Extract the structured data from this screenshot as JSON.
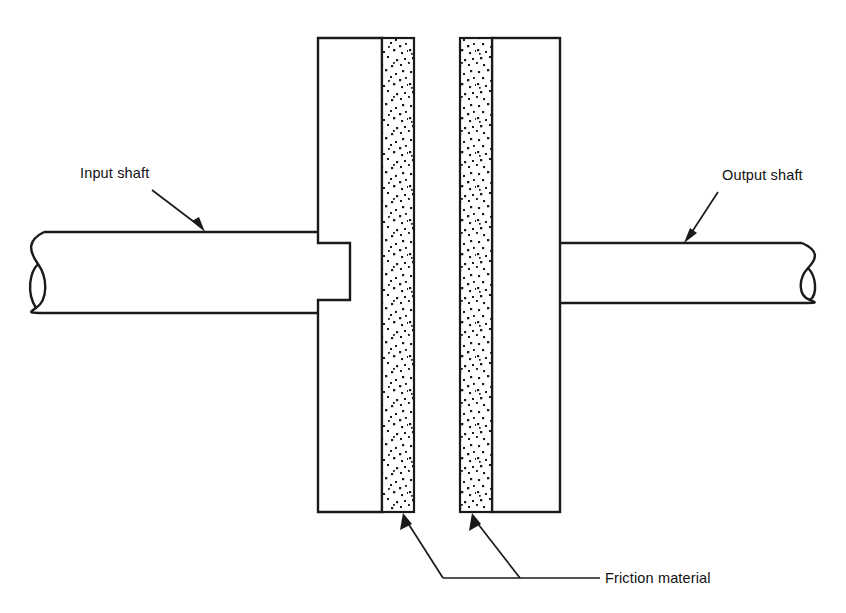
{
  "figure": {
    "background_color": "#ffffff",
    "line_color": "#1a1a1a",
    "stipple_color": "#1a1a1a",
    "width": 846,
    "height": 613
  },
  "labels": {
    "input_shaft": "Input shaft",
    "output_shaft": "Output shaft",
    "friction_material": "Friction material"
  },
  "components": {
    "input_shaft": {
      "name": "Input shaft",
      "side": "left",
      "x_start": 30,
      "x_end": 320,
      "y_top": 232,
      "y_bottom": 313,
      "break_line": true
    },
    "output_shaft": {
      "name": "Output shaft",
      "side": "right",
      "x_start": 560,
      "x_end": 818,
      "y_top": 243,
      "y_bottom": 303,
      "break_line": true
    },
    "driving_plate": {
      "name": "Driving plate",
      "x_start": 318,
      "x_end": 414,
      "y_top": 38,
      "y_bottom": 512,
      "friction_face": "right"
    },
    "driven_plate": {
      "name": "Driven plate",
      "x_start": 460,
      "x_end": 560,
      "y_top": 38,
      "y_bottom": 512,
      "friction_face": "left"
    },
    "friction_band_left": {
      "name": "Friction material (driving plate)",
      "x_start": 382,
      "x_end": 414,
      "y_top": 38,
      "y_bottom": 512
    },
    "friction_band_right": {
      "name": "Friction material (driven plate)",
      "x_start": 460,
      "x_end": 492,
      "y_top": 38,
      "y_bottom": 512
    },
    "keyway": {
      "name": "Keyway hub boss",
      "x_start": 320,
      "x_end": 350,
      "y_top": 243,
      "y_bottom": 300
    },
    "air_gap": {
      "name": "Clutch air gap",
      "x_start": 414,
      "x_end": 460
    }
  },
  "annotations": [
    {
      "id": "input-shaft",
      "text": "Input shaft",
      "text_x": 80,
      "text_y": 178,
      "leader_from_x": 152,
      "leader_from_y": 190,
      "leader_to_x": 205,
      "leader_to_y": 232
    },
    {
      "id": "output-shaft",
      "text": "Output shaft",
      "text_x": 722,
      "text_y": 180,
      "leader_from_x": 718,
      "leader_from_y": 192,
      "leader_to_x": 684,
      "leader_to_y": 243
    },
    {
      "id": "friction-material",
      "text": "Friction material",
      "text_x": 605,
      "text_y": 583,
      "leader_horizontal_y": 578,
      "leader_horizontal_x_start": 443,
      "leader_horizontal_x_end": 600,
      "arrow_left_x": 403,
      "arrow_right_x": 472,
      "arrow_tip_y": 512
    }
  ]
}
